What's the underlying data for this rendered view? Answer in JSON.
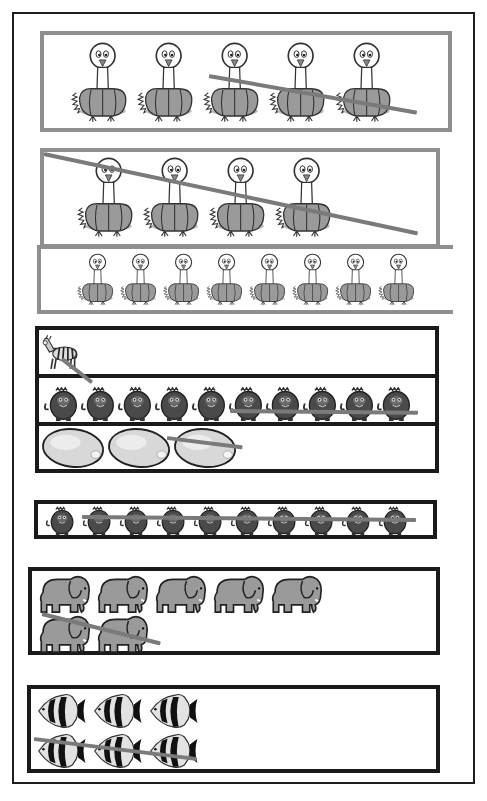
{
  "page": {
    "type": "worksheet",
    "corner_text_fragment": "g y"
  },
  "colors": {
    "outer_frame": "#1e1e1e",
    "gray_frame": "#8f8f8f",
    "black_frame": "#1a1a1a",
    "strike_line": "#7a7a7a",
    "animal_fill": "#9a9a9a",
    "monkey_fill": "#4a4a4a"
  },
  "sections": [
    {
      "id": "ostrich-group-1",
      "frame": "gray",
      "rows": [
        {
          "item": "ostrich",
          "icon": "ostrich-icon",
          "count": 5,
          "crossed_out": 3,
          "size": "large"
        }
      ]
    },
    {
      "id": "ostrich-group-2",
      "frame": "gray",
      "rows": [
        {
          "item": "ostrich",
          "icon": "ostrich-icon",
          "count": 4,
          "crossed_out": 4,
          "size": "large"
        },
        {
          "item": "ostrich",
          "icon": "ostrich-icon",
          "count": 8,
          "crossed_out": 0,
          "size": "small"
        }
      ]
    },
    {
      "id": "mixed-group",
      "frame": "black",
      "rows": [
        {
          "item": "zebra",
          "icon": "zebra-icon",
          "count": 1,
          "crossed_out": 1
        },
        {
          "item": "monkey",
          "icon": "monkey-icon",
          "count": 10,
          "crossed_out": 5
        },
        {
          "item": "lemon",
          "icon": "lemon-icon",
          "count": 3,
          "crossed_out": 1
        }
      ]
    },
    {
      "id": "monkey-group",
      "frame": "black",
      "rows": [
        {
          "item": "monkey",
          "icon": "monkey-icon",
          "count": 10,
          "crossed_out": 9
        }
      ]
    },
    {
      "id": "elephant-group",
      "frame": "black",
      "rows": [
        {
          "item": "elephant",
          "icon": "elephant-icon",
          "count": 5,
          "crossed_out": 0
        },
        {
          "item": "elephant",
          "icon": "elephant-icon",
          "count": 2,
          "crossed_out": 2
        }
      ]
    },
    {
      "id": "fish-group",
      "frame": "black",
      "rows": [
        {
          "item": "angelfish",
          "icon": "fish-icon",
          "count": 3,
          "crossed_out": 0
        },
        {
          "item": "angelfish",
          "icon": "fish-icon",
          "count": 3,
          "crossed_out": 3
        }
      ]
    }
  ]
}
